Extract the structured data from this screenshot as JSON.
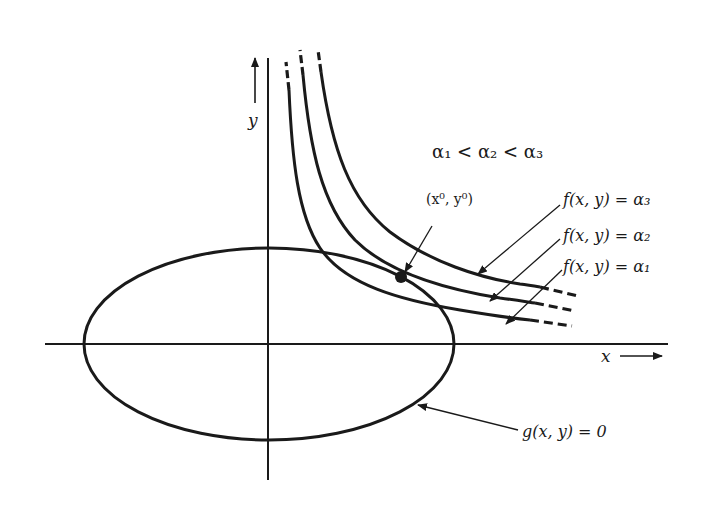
{
  "figure": {
    "axes": {
      "x_label": "x",
      "y_label": "y"
    },
    "ordering_label": "α₁ < α₂ < α₃",
    "point_label": "(x⁰, y⁰)",
    "curves": [
      {
        "id": "alpha3",
        "label": "f(x, y) = α₃"
      },
      {
        "id": "alpha2",
        "label": "f(x, y) = α₂"
      },
      {
        "id": "alpha1",
        "label": "f(x, y) = α₁"
      }
    ],
    "constraint_label": "g(x, y) = 0",
    "colors": {
      "ink": "#1a1a1a",
      "background": "#ffffff"
    }
  }
}
